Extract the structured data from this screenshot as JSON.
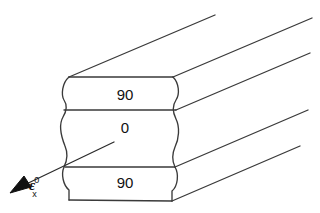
{
  "figure": {
    "kind": "laminate-stacking-sequence-diagram",
    "background_color": "#ffffff",
    "line_color": "#3a3a3a",
    "text_color": "#111111"
  },
  "plies": [
    {
      "id": "top",
      "label": "90"
    },
    {
      "id": "middle",
      "label": "0"
    },
    {
      "id": "bottom",
      "label": "90"
    }
  ],
  "strain_annotation": {
    "symbol": "ε",
    "superscript": "0",
    "subscript": "x",
    "arrow": "down-left-solid-triangle"
  }
}
